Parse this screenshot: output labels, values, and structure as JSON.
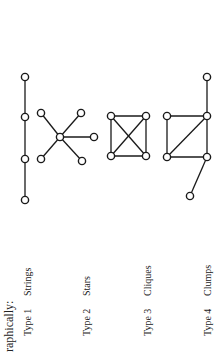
{
  "heading": "raphically:",
  "types": [
    {
      "type_label": "Type 1",
      "name": "Strings"
    },
    {
      "type_label": "Type 2",
      "name": "Stars"
    },
    {
      "type_label": "Type 3",
      "name": "Cliques"
    },
    {
      "type_label": "Type 4",
      "name": "Clumps"
    }
  ],
  "graphs": {
    "strings": {
      "nodes": [
        [
          25,
          77
        ],
        [
          25,
          117
        ],
        [
          25,
          159
        ],
        [
          25,
          200
        ]
      ],
      "edges": [
        [
          0,
          1
        ],
        [
          1,
          2
        ],
        [
          2,
          3
        ]
      ]
    },
    "stars": {
      "nodes": [
        [
          60,
          137
        ],
        [
          41,
          113
        ],
        [
          81,
          113
        ],
        [
          94,
          137
        ],
        [
          41,
          159
        ],
        [
          82,
          161
        ]
      ],
      "edges": [
        [
          0,
          1
        ],
        [
          0,
          2
        ],
        [
          0,
          3
        ],
        [
          0,
          4
        ],
        [
          0,
          5
        ]
      ]
    },
    "cliques": {
      "nodes": [
        [
          111,
          116
        ],
        [
          146,
          116
        ],
        [
          111,
          156
        ],
        [
          146,
          156
        ]
      ],
      "edges": [
        [
          0,
          1
        ],
        [
          2,
          3
        ],
        [
          0,
          2
        ],
        [
          1,
          3
        ],
        [
          0,
          3
        ],
        [
          1,
          2
        ]
      ]
    },
    "clumps": {
      "nodes": [
        [
          207,
          77
        ],
        [
          167,
          116
        ],
        [
          207,
          116
        ],
        [
          167,
          157
        ],
        [
          207,
          157
        ],
        [
          190,
          196
        ]
      ],
      "edges": [
        [
          0,
          2
        ],
        [
          1,
          2
        ],
        [
          1,
          3
        ],
        [
          3,
          4
        ],
        [
          2,
          4
        ],
        [
          3,
          2
        ],
        [
          4,
          5
        ]
      ]
    }
  },
  "style": {
    "stroke": "#1a1a1a",
    "node_radius": 3.6,
    "background": "#ffffff"
  }
}
